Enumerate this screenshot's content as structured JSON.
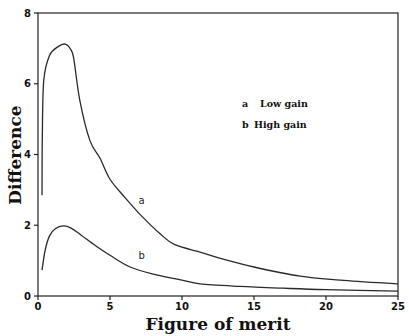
{
  "chart_data": {
    "type": "line",
    "title": "",
    "xlabel": "Figure of merit",
    "ylabel": "Difference",
    "xlim": [
      0,
      25
    ],
    "ylim": [
      0,
      8
    ],
    "xticks": [
      0,
      5,
      10,
      15,
      20,
      25
    ],
    "yticks": [
      0,
      2,
      4,
      6,
      8
    ],
    "grid": false,
    "legend": {
      "position": "upper right (inside)",
      "entries": [
        {
          "key": "a",
          "label": "Low gain"
        },
        {
          "key": "b",
          "label": "High gain"
        }
      ]
    },
    "series": [
      {
        "name": "a",
        "label": "Low gain",
        "x": [
          0.28,
          0.3,
          0.4,
          0.8,
          1.4,
          1.9,
          2.3,
          2.5,
          2.9,
          3.6,
          4.3,
          5.0,
          6.0,
          7.1,
          8.5,
          9.5,
          11.25,
          12.6,
          15.0,
          18.2,
          21.0,
          25.0
        ],
        "y": [
          2.85,
          4.5,
          6.1,
          6.8,
          7.05,
          7.12,
          6.95,
          6.67,
          5.54,
          4.4,
          3.9,
          3.3,
          2.8,
          2.3,
          1.75,
          1.45,
          1.24,
          1.07,
          0.82,
          0.56,
          0.45,
          0.34
        ]
      },
      {
        "name": "b",
        "label": "High gain",
        "x": [
          0.28,
          0.5,
          0.8,
          1.2,
          1.75,
          2.3,
          3.0,
          4.0,
          5.0,
          6.4,
          8.0,
          10.0,
          11.25,
          14.0,
          17.0,
          20.0,
          25.0
        ],
        "y": [
          0.73,
          1.3,
          1.7,
          1.9,
          1.98,
          1.92,
          1.72,
          1.42,
          1.15,
          0.82,
          0.62,
          0.45,
          0.34,
          0.27,
          0.22,
          0.18,
          0.14
        ]
      }
    ],
    "annotations": [
      {
        "text": "a",
        "x": 7.2,
        "y": 2.6
      },
      {
        "text": "b",
        "x": 7.2,
        "y": 1.05
      }
    ]
  },
  "colors": {
    "line": "#2a2a2a",
    "axis": "#222222",
    "background": "#ffffff"
  }
}
